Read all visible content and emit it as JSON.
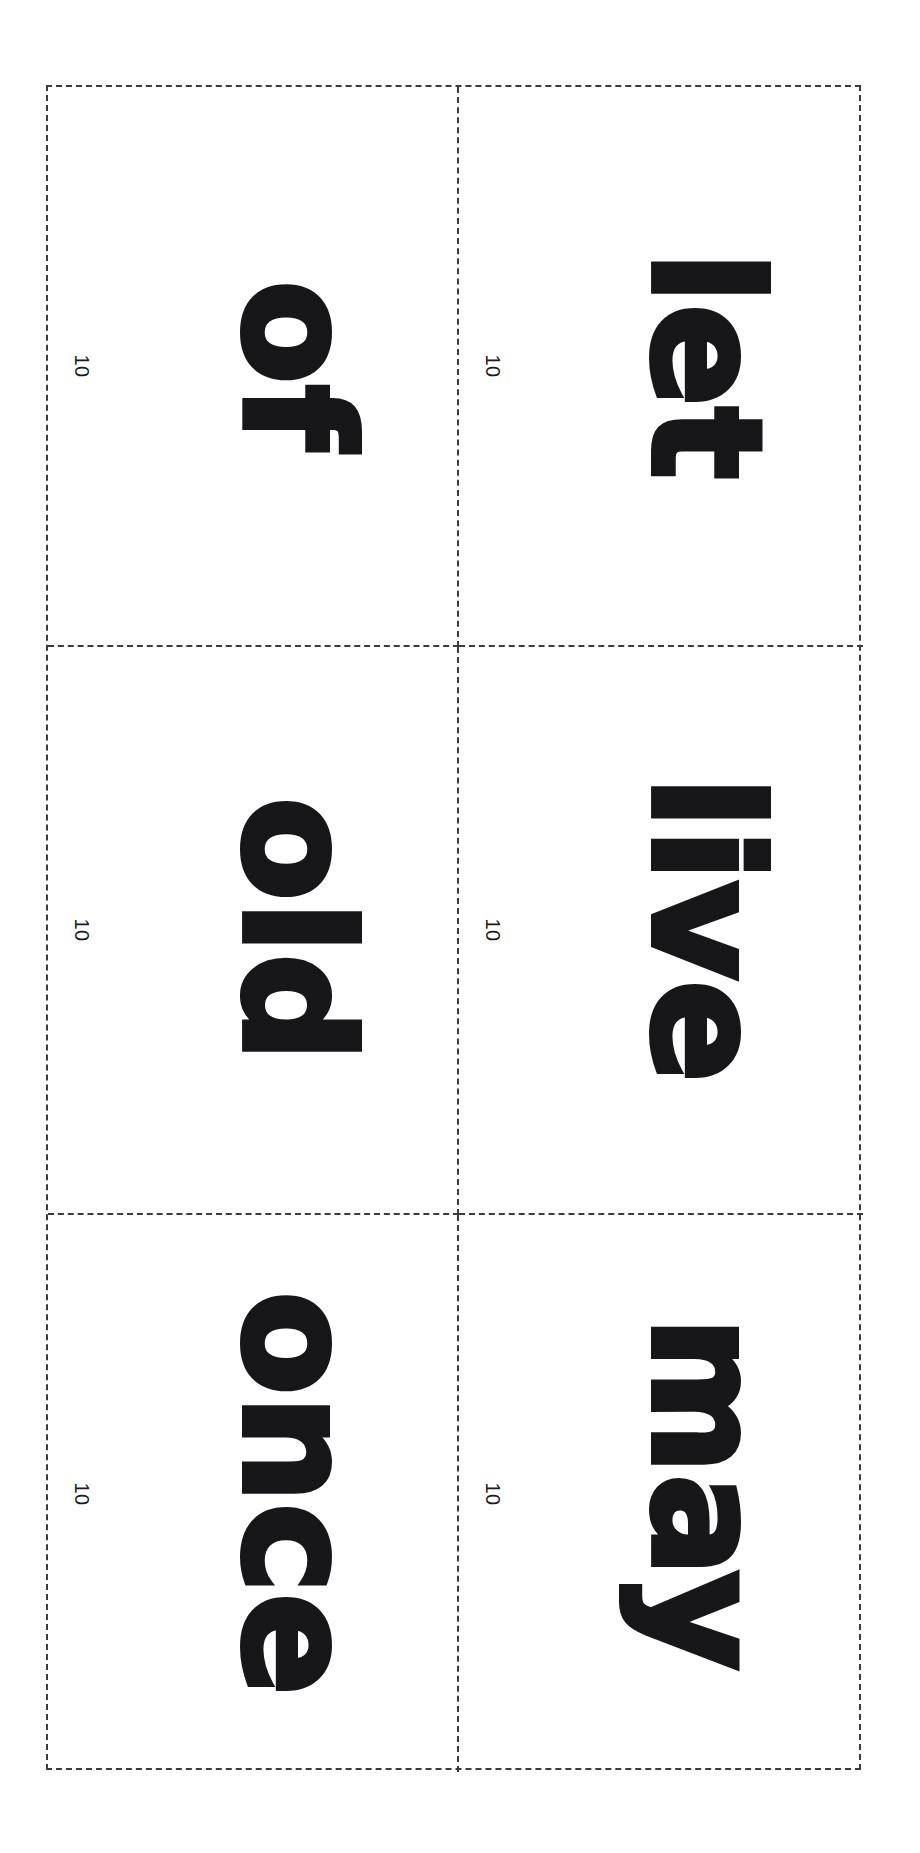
{
  "document": {
    "type": "flashcard-sheet",
    "orientation": "landscape-rotated",
    "grid": {
      "columns": 2,
      "rows": 3
    },
    "cut_line_style": "dashed",
    "colors": {
      "page_background": "#ffffff",
      "cut_line": "#3a3a40",
      "word_text": "#17171a",
      "tag_text": "#1b1b1f"
    }
  },
  "cards": [
    {
      "id": "card-1",
      "row": 1,
      "column": 1,
      "word": "of",
      "tag": "10"
    },
    {
      "id": "card-2",
      "row": 1,
      "column": 2,
      "word": "let",
      "tag": "10"
    },
    {
      "id": "card-3",
      "row": 2,
      "column": 1,
      "word": "old",
      "tag": "10"
    },
    {
      "id": "card-4",
      "row": 2,
      "column": 2,
      "word": "live",
      "tag": "10"
    },
    {
      "id": "card-5",
      "row": 3,
      "column": 1,
      "word": "once",
      "tag": "10"
    },
    {
      "id": "card-6",
      "row": 3,
      "column": 2,
      "word": "may",
      "tag": "10"
    }
  ]
}
